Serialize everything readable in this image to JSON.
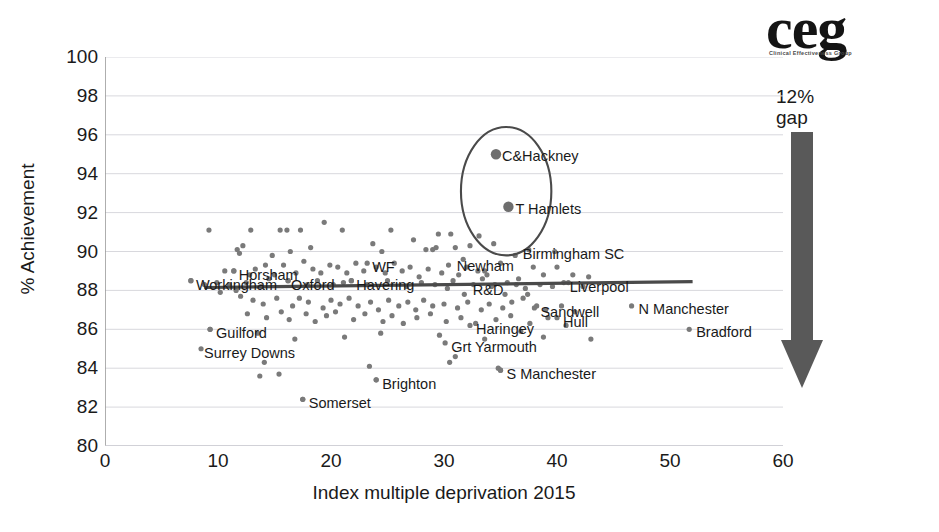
{
  "logo": {
    "name": "ceg",
    "subtitle": "Clinical Effectiveness Group"
  },
  "annotation": {
    "gap_line1": "12%",
    "gap_line2": "gap",
    "arrow_name": "down-arrow"
  },
  "chart_data": {
    "type": "scatter",
    "title": "",
    "xlabel": "Index multiple deprivation 2015",
    "ylabel": "% Achievement",
    "xlim": [
      0,
      60
    ],
    "ylim": [
      80,
      100
    ],
    "xticks": [
      "0",
      "10",
      "20",
      "30",
      "40",
      "50",
      "60"
    ],
    "yticks": [
      "100",
      "98",
      "96",
      "94",
      "92",
      "90",
      "88",
      "86",
      "84",
      "82",
      "80"
    ],
    "grid": true,
    "legend": "none",
    "point_color": "#7a7a7a",
    "highlight_color": "#6e6e6e",
    "trendline": {
      "color": "#4a4a4a",
      "x_start": 8.8,
      "x_end": 52.0,
      "y_start": 88.15,
      "y_end": 88.45
    },
    "highlight_ellipse": {
      "cx": 35.5,
      "cy": 93.1,
      "rx": 4.0,
      "ry": 3.3,
      "color": "#4a4a4a"
    },
    "labelled_points": [
      {
        "label": "C&Hackney",
        "x": 34.6,
        "y": 95.0,
        "highlight": true,
        "dx": 6,
        "dy": -5
      },
      {
        "label": "T Hamlets",
        "x": 35.7,
        "y": 92.3,
        "highlight": true,
        "dx": 7,
        "dy": -5
      },
      {
        "label": "Newham",
        "x": 33.6,
        "y": 89.0,
        "highlight": false,
        "dx": -28,
        "dy": -12
      },
      {
        "label": "R&D",
        "x": 34.5,
        "y": 88.3,
        "highlight": false,
        "dx": -22,
        "dy": -2
      },
      {
        "label": "Birmingham SC",
        "x": 37.5,
        "y": 90.1,
        "highlight": false,
        "dx": -6,
        "dy": -3
      },
      {
        "label": "Liverpool",
        "x": 40.6,
        "y": 88.4,
        "highlight": false,
        "dx": 6,
        "dy": -3
      },
      {
        "label": "Sandwell",
        "x": 38.0,
        "y": 87.1,
        "highlight": false,
        "dx": 6,
        "dy": -3
      },
      {
        "label": "Hull",
        "x": 40.0,
        "y": 86.6,
        "highlight": false,
        "dx": 6,
        "dy": -3
      },
      {
        "label": "N Manchester",
        "x": 46.6,
        "y": 87.2,
        "highlight": false,
        "dx": 7,
        "dy": -4
      },
      {
        "label": "Bradford",
        "x": 51.7,
        "y": 86.0,
        "highlight": false,
        "dx": 7,
        "dy": -4
      },
      {
        "label": "Haringey",
        "x": 32.3,
        "y": 86.2,
        "highlight": false,
        "dx": 6,
        "dy": -3
      },
      {
        "label": "Grt Yarmouth",
        "x": 30.1,
        "y": 85.3,
        "highlight": false,
        "dx": 6,
        "dy": -3
      },
      {
        "label": "S Manchester",
        "x": 35.0,
        "y": 83.9,
        "highlight": false,
        "dx": 6,
        "dy": -3
      },
      {
        "label": "Brighton",
        "x": 24.0,
        "y": 83.4,
        "highlight": false,
        "dx": 6,
        "dy": -3
      },
      {
        "label": "Somerset",
        "x": 17.5,
        "y": 82.4,
        "highlight": false,
        "dx": 6,
        "dy": -3
      },
      {
        "label": "Guilford",
        "x": 9.3,
        "y": 86.0,
        "highlight": false,
        "dx": 6,
        "dy": -3
      },
      {
        "label": "Surrey Downs",
        "x": 8.5,
        "y": 85.0,
        "highlight": false,
        "dx": 3,
        "dy": -3
      },
      {
        "label": "Horsham",
        "x": 11.4,
        "y": 89.0,
        "highlight": false,
        "dx": 5,
        "dy": -3
      },
      {
        "label": "Workingham",
        "x": 7.6,
        "y": 88.5,
        "highlight": false,
        "dx": 5,
        "dy": -3
      },
      {
        "label": "Oxford",
        "x": 16.2,
        "y": 88.5,
        "highlight": false,
        "dx": 3,
        "dy": -3
      },
      {
        "label": "Havering",
        "x": 21.8,
        "y": 88.5,
        "highlight": false,
        "dx": 5,
        "dy": -3
      },
      {
        "label": "WF",
        "x": 23.2,
        "y": 89.4,
        "highlight": false,
        "dx": 5,
        "dy": -3
      }
    ],
    "points": [
      [
        9.2,
        91.1
      ],
      [
        12.9,
        91.1
      ],
      [
        15.5,
        91.1
      ],
      [
        16.1,
        91.1
      ],
      [
        17.3,
        91.1
      ],
      [
        19.4,
        91.5
      ],
      [
        21.0,
        91.1
      ],
      [
        25.3,
        91.1
      ],
      [
        29.5,
        90.9
      ],
      [
        30.6,
        90.9
      ],
      [
        11.7,
        90.1
      ],
      [
        11.9,
        89.9
      ],
      [
        12.2,
        90.3
      ],
      [
        14.8,
        89.8
      ],
      [
        16.4,
        90.0
      ],
      [
        18.2,
        90.2
      ],
      [
        23.7,
        90.4
      ],
      [
        24.5,
        90.0
      ],
      [
        27.3,
        90.6
      ],
      [
        28.4,
        90.1
      ],
      [
        29.0,
        90.1
      ],
      [
        29.3,
        90.2
      ],
      [
        31.0,
        90.2
      ],
      [
        31.7,
        89.6
      ],
      [
        32.3,
        90.3
      ],
      [
        10.6,
        89.0
      ],
      [
        11.4,
        89.0
      ],
      [
        13.3,
        89.1
      ],
      [
        14.2,
        89.3
      ],
      [
        15.0,
        88.8
      ],
      [
        15.8,
        89.3
      ],
      [
        16.9,
        88.9
      ],
      [
        17.6,
        89.5
      ],
      [
        18.4,
        89.1
      ],
      [
        19.1,
        88.9
      ],
      [
        19.9,
        89.3
      ],
      [
        20.6,
        89.2
      ],
      [
        21.4,
        88.9
      ],
      [
        22.2,
        89.4
      ],
      [
        22.9,
        89.0
      ],
      [
        24.0,
        89.2
      ],
      [
        24.8,
        88.9
      ],
      [
        25.6,
        89.4
      ],
      [
        26.3,
        89.0
      ],
      [
        27.0,
        89.2
      ],
      [
        27.8,
        88.7
      ],
      [
        28.6,
        89.1
      ],
      [
        29.8,
        88.9
      ],
      [
        30.4,
        89.3
      ],
      [
        31.3,
        88.8
      ],
      [
        32.0,
        89.2
      ],
      [
        33.0,
        89.0
      ],
      [
        33.8,
        88.8
      ],
      [
        7.6,
        88.5
      ],
      [
        9.9,
        88.4
      ],
      [
        11.0,
        88.3
      ],
      [
        12.5,
        88.4
      ],
      [
        13.8,
        88.2
      ],
      [
        14.5,
        88.6
      ],
      [
        16.2,
        88.5
      ],
      [
        17.9,
        88.3
      ],
      [
        18.8,
        88.5
      ],
      [
        20.2,
        88.3
      ],
      [
        21.1,
        88.4
      ],
      [
        21.8,
        88.5
      ],
      [
        23.2,
        88.3
      ],
      [
        25.0,
        88.5
      ],
      [
        26.7,
        88.2
      ],
      [
        28.0,
        88.4
      ],
      [
        29.2,
        88.3
      ],
      [
        30.8,
        88.5
      ],
      [
        32.6,
        88.3
      ],
      [
        34.2,
        88.2
      ],
      [
        35.6,
        88.4
      ],
      [
        36.4,
        88.3
      ],
      [
        37.2,
        88.1
      ],
      [
        38.5,
        88.3
      ],
      [
        39.6,
        88.2
      ],
      [
        41.0,
        88.4
      ],
      [
        42.3,
        88.2
      ],
      [
        12.0,
        87.7
      ],
      [
        13.1,
        87.5
      ],
      [
        14.0,
        87.3
      ],
      [
        15.2,
        87.6
      ],
      [
        16.6,
        87.2
      ],
      [
        17.2,
        87.6
      ],
      [
        18.0,
        87.4
      ],
      [
        19.3,
        87.1
      ],
      [
        20.0,
        87.5
      ],
      [
        20.8,
        87.3
      ],
      [
        21.6,
        87.6
      ],
      [
        22.4,
        87.2
      ],
      [
        23.5,
        87.4
      ],
      [
        24.2,
        87.0
      ],
      [
        25.1,
        87.5
      ],
      [
        26.0,
        87.2
      ],
      [
        26.8,
        87.4
      ],
      [
        27.5,
        87.0
      ],
      [
        28.2,
        87.5
      ],
      [
        29.0,
        87.2
      ],
      [
        30.0,
        87.3
      ],
      [
        31.2,
        87.1
      ],
      [
        32.1,
        87.4
      ],
      [
        33.3,
        87.0
      ],
      [
        34.0,
        87.3
      ],
      [
        35.2,
        87.1
      ],
      [
        36.0,
        87.4
      ],
      [
        37.0,
        87.6
      ],
      [
        38.2,
        87.2
      ],
      [
        39.0,
        87.0
      ],
      [
        40.4,
        87.2
      ],
      [
        41.6,
        86.9
      ],
      [
        12.6,
        86.8
      ],
      [
        14.3,
        86.6
      ],
      [
        15.6,
        86.9
      ],
      [
        16.3,
        86.5
      ],
      [
        17.8,
        86.8
      ],
      [
        18.6,
        86.4
      ],
      [
        19.6,
        86.7
      ],
      [
        20.4,
        86.9
      ],
      [
        22.0,
        86.5
      ],
      [
        23.0,
        86.8
      ],
      [
        24.6,
        86.4
      ],
      [
        25.4,
        86.7
      ],
      [
        26.4,
        86.3
      ],
      [
        27.6,
        86.6
      ],
      [
        28.8,
        86.8
      ],
      [
        30.2,
        86.4
      ],
      [
        31.5,
        86.6
      ],
      [
        32.8,
        86.3
      ],
      [
        34.6,
        86.5
      ],
      [
        35.9,
        86.7
      ],
      [
        37.6,
        86.3
      ],
      [
        39.2,
        86.6
      ],
      [
        40.8,
        86.2
      ],
      [
        9.3,
        86.0
      ],
      [
        13.5,
        85.8
      ],
      [
        16.8,
        85.5
      ],
      [
        21.2,
        85.6
      ],
      [
        24.4,
        85.8
      ],
      [
        29.6,
        85.7
      ],
      [
        33.6,
        85.5
      ],
      [
        36.8,
        85.9
      ],
      [
        38.8,
        85.6
      ],
      [
        43.0,
        85.5
      ],
      [
        14.1,
        84.3
      ],
      [
        15.4,
        83.7
      ],
      [
        23.4,
        84.1
      ],
      [
        30.5,
        84.3
      ],
      [
        34.8,
        84.0
      ],
      [
        13.7,
        83.6
      ],
      [
        24.0,
        83.4
      ],
      [
        17.5,
        82.4
      ],
      [
        35.0,
        83.9
      ],
      [
        31.0,
        84.6
      ],
      [
        36.3,
        89.8
      ],
      [
        37.9,
        89.2
      ],
      [
        34.4,
        90.4
      ],
      [
        33.1,
        90.8
      ],
      [
        35.0,
        89.4
      ],
      [
        38.8,
        88.8
      ],
      [
        40.0,
        89.2
      ],
      [
        41.4,
        88.8
      ],
      [
        42.8,
        88.7
      ],
      [
        39.8,
        90.0
      ],
      [
        8.8,
        88.3
      ],
      [
        10.2,
        87.9
      ],
      [
        11.6,
        88.0
      ],
      [
        12.8,
        88.8
      ],
      [
        33.4,
        88.6
      ],
      [
        35.4,
        87.8
      ],
      [
        36.6,
        88.6
      ],
      [
        37.4,
        87.8
      ],
      [
        30.3,
        88.1
      ],
      [
        31.8,
        87.8
      ]
    ]
  }
}
